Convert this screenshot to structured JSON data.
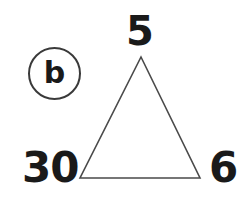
{
  "page": {
    "background_color": "#ffffff",
    "width": 250,
    "height": 211
  },
  "problem": {
    "label": "b",
    "label_shape": "circle",
    "stroke_color": "#3a3a3a"
  },
  "figure": {
    "type": "triangle",
    "stroke_color": "#4a4a4a",
    "fill": "none",
    "stroke_width": 1.5,
    "apex": {
      "x": 141,
      "y": 57
    },
    "bottom_left": {
      "x": 80,
      "y": 178
    },
    "bottom_right": {
      "x": 200,
      "y": 178
    }
  },
  "labels": {
    "top": "5",
    "bottom_left": "30",
    "bottom_right": "6"
  },
  "chart_data": {
    "type": "diagram",
    "title": "",
    "subtitle": "",
    "diagram_kind": "number-triangle-puzzle",
    "problem_letter": "b",
    "nodes": [
      {
        "name": "top",
        "value": 5,
        "position": "apex"
      },
      {
        "name": "bottom_left",
        "value": 30,
        "position": "left-of-bottom-left-vertex"
      },
      {
        "name": "bottom_right",
        "value": 6,
        "position": "right-of-bottom-right-vertex"
      }
    ],
    "values": [
      5,
      30,
      6
    ],
    "categories": [
      "top",
      "bottom_left",
      "bottom_right"
    ],
    "annotations": [
      "b"
    ]
  }
}
